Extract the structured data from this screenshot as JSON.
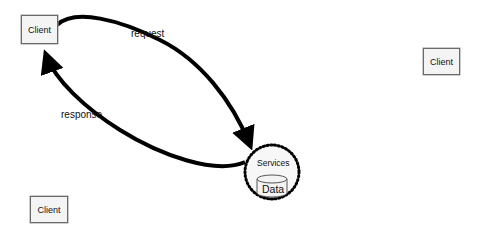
{
  "diagram": {
    "nodes": [
      {
        "id": "client-1",
        "label": "Client"
      },
      {
        "id": "client-2",
        "label": "Client"
      },
      {
        "id": "client-3",
        "label": "Client"
      },
      {
        "id": "services",
        "label": "Services"
      },
      {
        "id": "data",
        "label": "Data"
      }
    ],
    "edges": [
      {
        "from": "client-1",
        "to": "services",
        "label": "request"
      },
      {
        "from": "services",
        "to": "client-1",
        "label": "response"
      }
    ]
  }
}
